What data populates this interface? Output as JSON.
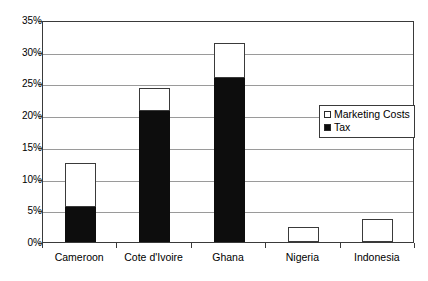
{
  "chart_data": {
    "type": "bar",
    "stacked": true,
    "title": "",
    "xlabel": "",
    "ylabel": "",
    "ylim": [
      0,
      35
    ],
    "ytick_values": [
      0,
      5,
      10,
      15,
      20,
      25,
      30,
      35
    ],
    "ytick_labels": [
      "0%",
      "5%",
      "10%",
      "15%",
      "20%",
      "25%",
      "30%",
      "35%"
    ],
    "grid": "horizontal",
    "legend_position": "inside-right",
    "categories": [
      "Cameroon",
      "Cote d'Ivoire",
      "Ghana",
      "Nigeria",
      "Indonesia"
    ],
    "series": [
      {
        "name": "Tax",
        "color": "#0d0d0d",
        "values": [
          5.5,
          20.7,
          25.8,
          0.0,
          0.0
        ]
      },
      {
        "name": "Marketing Costs",
        "color": "#ffffff",
        "values": [
          7.0,
          3.6,
          5.5,
          2.3,
          3.6
        ]
      }
    ],
    "totals": [
      12.5,
      24.3,
      31.3,
      2.3,
      3.6
    ]
  },
  "legend": {
    "items": [
      {
        "label": "Marketing Costs",
        "swatch": "white-square-icon"
      },
      {
        "label": "Tax",
        "swatch": "black-square-icon"
      }
    ]
  },
  "colors": {
    "tax": "#0d0d0d",
    "marketing": "#ffffff",
    "axis": "#3a3a3a",
    "grid": "#9a9a9a",
    "background": "#ffffff"
  }
}
